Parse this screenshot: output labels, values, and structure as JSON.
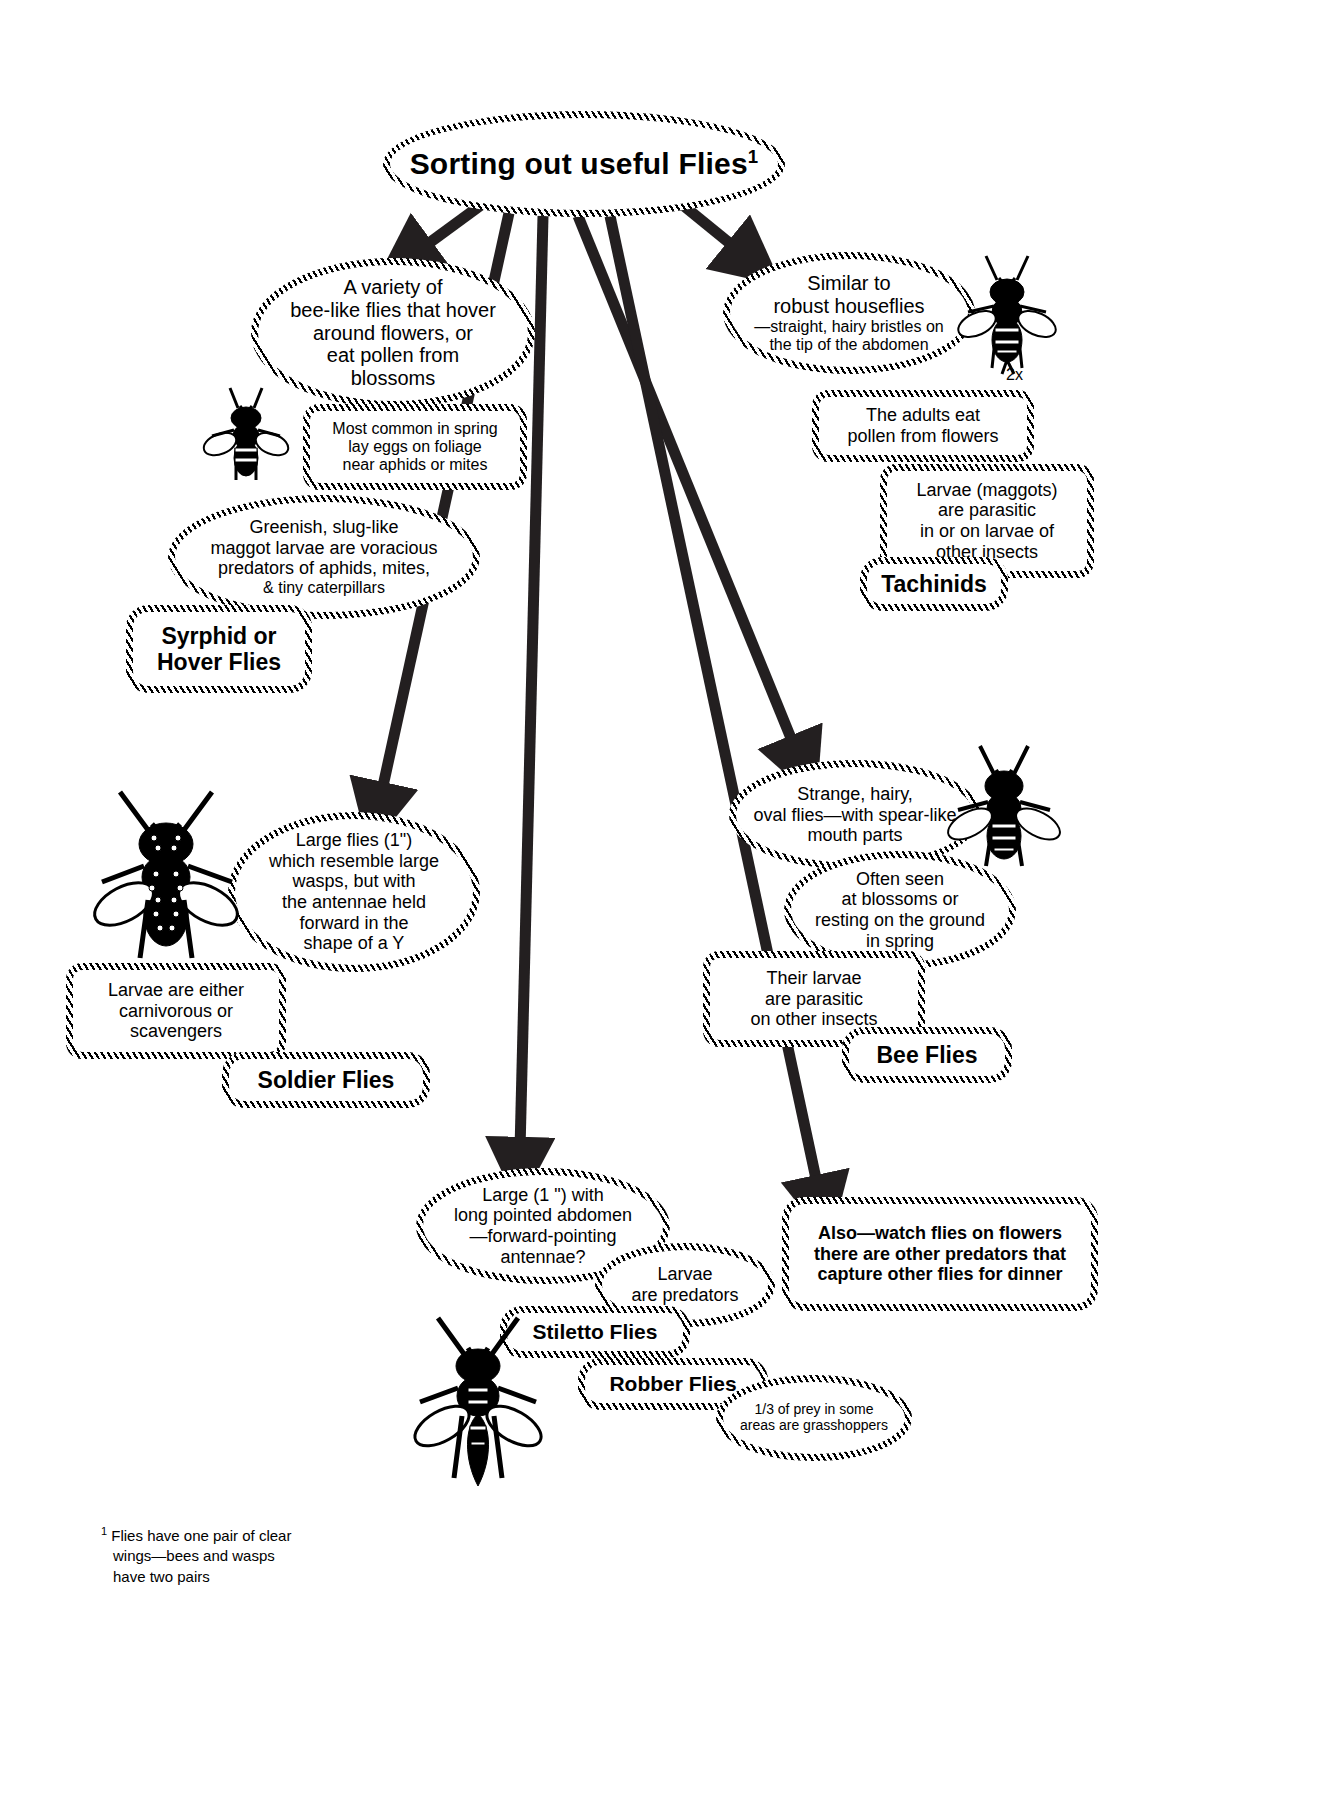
{
  "title": {
    "text": "Sorting out useful Flies",
    "footnote_marker": "1"
  },
  "footnote": {
    "marker": "1",
    "text": "Flies have one pair of clear wings—bees and wasps have two pairs"
  },
  "scale_label": "2x",
  "branches": [
    {
      "id": "syrphid",
      "category": "Syrphid or\nHover Flies",
      "nodes": [
        "A variety of\nbee-like flies that hover\naround flowers, or\neat pollen from\nblossoms",
        "Most common in spring\nlay eggs on foliage\nnear aphids or mites",
        "Greenish, slug-like\nmaggot larvae are voracious\npredators of aphids,  mites,\n& tiny caterpillars"
      ]
    },
    {
      "id": "tachinid",
      "category": "Tachinids",
      "nodes": [
        "Similar to\nrobust houseflies\n—straight, hairy bristles on\nthe tip of the abdomen",
        "The adults eat\npollen from flowers",
        "Larvae (maggots)\nare parasitic\nin or on  larvae of\nother insects"
      ]
    },
    {
      "id": "soldier",
      "category": "Soldier Flies",
      "nodes": [
        "Large flies (1\")\nwhich resemble large\nwasps, but with\nthe antennae held\nforward in the\nshape of a Y",
        "Larvae are either\ncarnivorous or\nscavengers"
      ]
    },
    {
      "id": "beeflies",
      "category": "Bee Flies",
      "nodes": [
        "Strange, hairy,\noval flies—with spear-like\nmouth parts",
        "Often seen\nat blossoms or\nresting on the ground\nin spring",
        "Their larvae\nare parasitic\non other insects"
      ]
    },
    {
      "id": "robber",
      "category_a": "Stiletto Flies",
      "category_b": "Robber Flies",
      "nodes": [
        "Large (1 \") with\nlong pointed abdomen\n—forward-pointing\nantennae?",
        "Larvae\nare predators",
        "1/3 of prey in some\nareas are grasshoppers"
      ]
    },
    {
      "id": "also",
      "nodes": [
        "Also—watch  flies on flowers\nthere are other predators that\ncapture other flies  for dinner"
      ]
    }
  ],
  "labels": {
    "title": "Sorting out useful Flies",
    "syrphid_n1": "A variety of bee-like flies that hover around flowers, or eat pollen from blossoms",
    "syrphid_n1_l1": "A variety of",
    "syrphid_n1_l2": "bee-like flies that hover",
    "syrphid_n1_l3": "around flowers, or",
    "syrphid_n1_l4": "eat pollen from",
    "syrphid_n1_l5": "blossoms",
    "syrphid_n2_l1": "Most common in spring",
    "syrphid_n2_l2": "lay eggs on foliage",
    "syrphid_n2_l3": "near aphids or mites",
    "syrphid_n3_l1": "Greenish, slug-like",
    "syrphid_n3_l2": "maggot larvae are voracious",
    "syrphid_n3_l3": "predators of aphids,  mites,",
    "syrphid_n3_l4": "& tiny caterpillars",
    "syrphid_cat_l1": "Syrphid or",
    "syrphid_cat_l2": "Hover Flies",
    "tach_n1_l1": "Similar to",
    "tach_n1_l2": "robust houseflies",
    "tach_n1_l3": "—straight, hairy bristles on",
    "tach_n1_l4": "the tip of the abdomen",
    "tach_n2_l1": "The adults eat",
    "tach_n2_l2": "pollen from flowers",
    "tach_n3_l1": "Larvae (maggots)",
    "tach_n3_l2": "are parasitic",
    "tach_n3_l3": "in or on  larvae of",
    "tach_n3_l4": "other insects",
    "tach_cat": "Tachinids",
    "sold_n1_l1": "Large flies (1\")",
    "sold_n1_l2": "which resemble large",
    "sold_n1_l3": "wasps, but with",
    "sold_n1_l4": "the antennae held",
    "sold_n1_l5": "forward in the",
    "sold_n1_l6": "shape of a Y",
    "sold_n2_l1": "Larvae are either",
    "sold_n2_l2": "carnivorous or",
    "sold_n2_l3": "scavengers",
    "sold_cat": "Soldier Flies",
    "bee_n1_l1": "Strange, hairy,",
    "bee_n1_l2": "oval flies—with spear-like",
    "bee_n1_l3": "mouth parts",
    "bee_n2_l1": "Often seen",
    "bee_n2_l2": "at blossoms or",
    "bee_n2_l3": "resting on the ground",
    "bee_n2_l4": "in spring",
    "bee_n3_l1": "Their larvae",
    "bee_n3_l2": "are parasitic",
    "bee_n3_l3": "on other insects",
    "bee_cat": "Bee Flies",
    "rob_n1_l1": "Large (1 \") with",
    "rob_n1_l2": "long pointed abdomen",
    "rob_n1_l3": "—forward-pointing",
    "rob_n1_l4": "antennae?",
    "rob_n2_l1": "Larvae",
    "rob_n2_l2": "are predators",
    "rob_cat_a": "Stiletto Flies",
    "rob_cat_b": "Robber Flies",
    "rob_n3_l1": "1/3 of prey in some",
    "rob_n3_l2": "areas are grasshoppers",
    "also_l1": "Also—watch  flies on flowers",
    "also_l2": "there are other predators that",
    "also_l3": "capture other flies  for dinner",
    "footnote_l1": "Flies have one pair of clear",
    "footnote_l2": "wings—bees and wasps",
    "footnote_l3": "have two pairs",
    "footnote_marker": "1",
    "scale": "2x"
  },
  "colors": {
    "ink": "#000000",
    "paper": "#ffffff",
    "arrow": "#231f20"
  }
}
